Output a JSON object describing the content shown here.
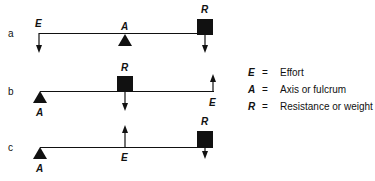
{
  "diagram": {
    "colors": {
      "ink": "#111111",
      "background": "#ffffff"
    },
    "panels": [
      {
        "id": "a",
        "label": "a",
        "effort": "E",
        "axis": "A",
        "resistance": "R"
      },
      {
        "id": "b",
        "label": "b",
        "effort": "E",
        "axis": "A",
        "resistance": "R"
      },
      {
        "id": "c",
        "label": "c",
        "effort": "E",
        "axis": "A",
        "resistance": "R"
      }
    ],
    "legend": [
      {
        "symbol": "E",
        "eq": "=",
        "meaning": "Effort"
      },
      {
        "symbol": "A",
        "eq": "=",
        "meaning": "Axis or fulcrum"
      },
      {
        "symbol": "R",
        "eq": "=",
        "meaning": "Resistance or weight"
      }
    ]
  }
}
